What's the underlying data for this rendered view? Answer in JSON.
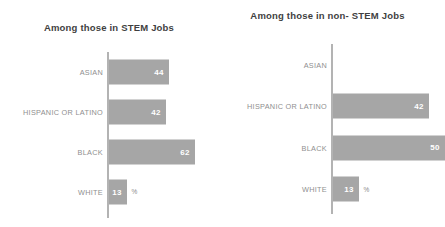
{
  "chart_data": [
    {
      "type": "bar",
      "orientation": "horizontal",
      "title": "Among those in STEM Jobs",
      "categories": [
        "ASIAN",
        "HISPANIC OR LATINO",
        "BLACK",
        "WHITE"
      ],
      "values": [
        44,
        42,
        62,
        13
      ],
      "value_labels": [
        "44",
        "42",
        "62",
        "13"
      ],
      "unit_suffix": "%",
      "unit_suffix_on": [
        "WHITE"
      ],
      "xlabel": "",
      "ylabel": "",
      "xlim": [
        0,
        70
      ],
      "grid": false,
      "legend": false,
      "bar_color": "#a6a6a6",
      "value_label_color": "#ffffff",
      "category_label_color": "#8f8f8f",
      "axis_color": "#b3b3b3"
    },
    {
      "type": "bar",
      "orientation": "horizontal",
      "title": "Among those in non- STEM Jobs",
      "categories": [
        "ASIAN",
        "HISPANIC OR LATINO",
        "BLACK",
        "WHITE"
      ],
      "values": [
        null,
        42,
        50,
        13
      ],
      "value_labels": [
        "",
        "42",
        "50",
        "13"
      ],
      "unit_suffix": "%",
      "unit_suffix_on": [
        "WHITE"
      ],
      "xlabel": "",
      "ylabel": "",
      "xlim": [
        0,
        70
      ],
      "grid": false,
      "legend": false,
      "bar_color": "#a6a6a6",
      "value_label_color": "#ffffff",
      "category_label_color": "#8f8f8f",
      "axis_color": "#b3b3b3"
    }
  ],
  "panels": {
    "left": {
      "title": "Among those in STEM Jobs",
      "rows": [
        {
          "label": "ASIAN",
          "value_label": "44",
          "bar_px": 60,
          "suffix": ""
        },
        {
          "label": "HISPANIC OR LATINO",
          "value_label": "42",
          "bar_px": 57,
          "suffix": ""
        },
        {
          "label": "BLACK",
          "value_label": "62",
          "bar_px": 86,
          "suffix": ""
        },
        {
          "label": "WHITE",
          "value_label": "13",
          "bar_px": 18,
          "suffix": "%"
        }
      ]
    },
    "right": {
      "title": "Among those in non- STEM Jobs",
      "rows": [
        {
          "label": "ASIAN",
          "value_label": "",
          "bar_px": 0,
          "suffix": ""
        },
        {
          "label": "HISPANIC OR LATINO",
          "value_label": "42",
          "bar_px": 96,
          "suffix": ""
        },
        {
          "label": "BLACK",
          "value_label": "50",
          "bar_px": 112,
          "suffix": ""
        },
        {
          "label": "WHITE",
          "value_label": "13",
          "bar_px": 26,
          "suffix": "%"
        }
      ]
    }
  }
}
